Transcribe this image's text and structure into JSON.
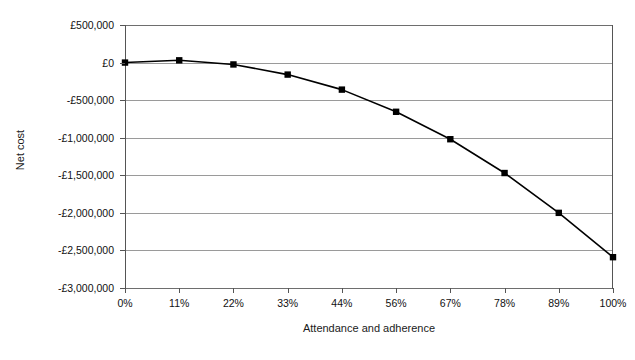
{
  "chart_data": {
    "type": "line",
    "title": "",
    "xlabel": "Attendance and adherence",
    "ylabel": "Net cost",
    "categories": [
      "0%",
      "11%",
      "22%",
      "33%",
      "44%",
      "56%",
      "67%",
      "78%",
      "89%",
      "100%"
    ],
    "series": [
      {
        "name": "Net cost",
        "values": [
          0,
          30000,
          -25000,
          -160000,
          -360000,
          -655000,
          -1020000,
          -1470000,
          -2000000,
          -2590000
        ]
      }
    ],
    "ylim": [
      -3000000,
      500000
    ],
    "ytick_values": [
      500000,
      0,
      -500000,
      -1000000,
      -1500000,
      -2000000,
      -2500000,
      -3000000
    ],
    "ytick_labels": [
      "£500,000",
      "£0",
      "-£500,000",
      "-£1,000,000",
      "-£1,500,000",
      "-£2,000,000",
      "-£2,500,000",
      "-£3,000,000"
    ],
    "grid": true,
    "legend": false,
    "marker": "square",
    "marker_color": "#000000",
    "line_color": "#000000",
    "grid_color": "#9a9a9a",
    "background_color": "#ffffff"
  }
}
